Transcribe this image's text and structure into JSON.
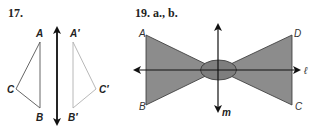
{
  "figure17": {
    "number": "17.",
    "original": {
      "labels": {
        "A": "A",
        "B": "B",
        "C": "C"
      }
    },
    "image": {
      "labels": {
        "A": "A′",
        "B": "B′",
        "C": "C′"
      }
    },
    "reflection_line": "vertical line with arrows"
  },
  "figure19": {
    "number": "19. a., b.",
    "labels": {
      "A": "A",
      "B": "B",
      "C": "C",
      "D": "D"
    },
    "line_l": "ℓ",
    "line_m": "m"
  },
  "colors": {
    "stroke": "#222222",
    "image_stroke": "#aaaaaa",
    "fill": "#8c8c8c",
    "oval_fill": "#7e7e7e"
  }
}
